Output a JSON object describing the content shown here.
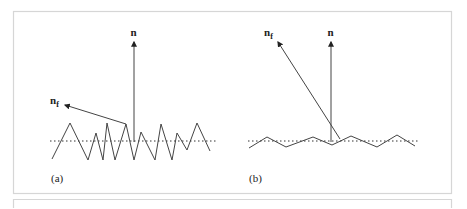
{
  "figure": {
    "panels": [
      {
        "id": "a",
        "caption": "(a)",
        "normal_label": "n",
        "facet_normal_label": "n",
        "facet_normal_subscript": "f",
        "surface_type": "rough (high-frequency, large amplitude zigzag)"
      },
      {
        "id": "b",
        "caption": "(b)",
        "normal_label": "n",
        "facet_normal_label": "n",
        "facet_normal_subscript": "f",
        "surface_type": "smooth (low amplitude zigzag)"
      }
    ],
    "colors": {
      "line": "#333333",
      "frame": "#d6d6d6",
      "background": "#ffffff"
    }
  }
}
